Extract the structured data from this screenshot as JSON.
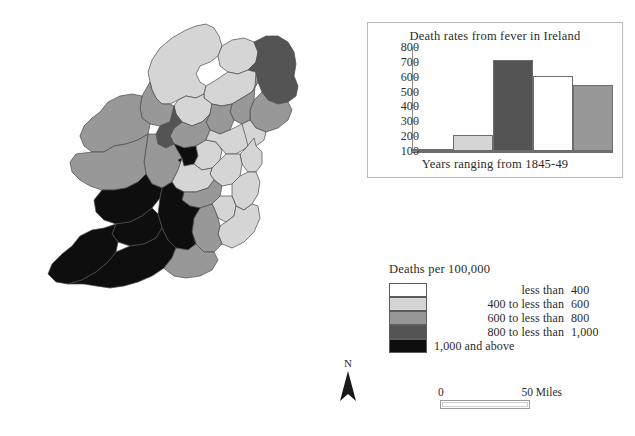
{
  "chart_data": {
    "type": "bar",
    "title": "Death rates from fever in Ireland",
    "xlabel": "Years ranging from 1845-49",
    "ylabel": "",
    "categories": [
      "1845",
      "1846",
      "1847",
      "1848",
      "1849"
    ],
    "values": [
      105,
      207,
      712,
      603,
      545
    ],
    "ylim": [
      100,
      800
    ],
    "yticks": [
      "800",
      "700",
      "600",
      "500",
      "400",
      "300",
      "200",
      "100"
    ],
    "grid": false,
    "legend_position": "none",
    "bar_colors": [
      "#808080",
      "#d5d5d5",
      "#545454",
      "#ffffff",
      "#989898"
    ]
  },
  "chart": {
    "title": "Death rates from fever in Ireland",
    "xlabel": "Years ranging from 1845-49"
  },
  "legend": {
    "title": "Deaths per 100,000",
    "rows": [
      {
        "label": "less than",
        "value": "400",
        "color": "#ffffff",
        "wide": false
      },
      {
        "label": "400 to less than",
        "value": "600",
        "color": "#d5d5d5",
        "wide": false
      },
      {
        "label": "600 to less than",
        "value": "800",
        "color": "#989898",
        "wide": false
      },
      {
        "label": "800 to less than",
        "value": "1,000",
        "color": "#545454",
        "wide": false
      },
      {
        "label": "1,000 and above",
        "value": "",
        "color": "#0e0e0e",
        "wide": true
      }
    ]
  },
  "north_arrow": {
    "letter": "N"
  },
  "scalebar": {
    "zero": "0",
    "max": "50 Miles"
  },
  "map": {
    "title": "Ireland county choropleth of fever death rates"
  }
}
